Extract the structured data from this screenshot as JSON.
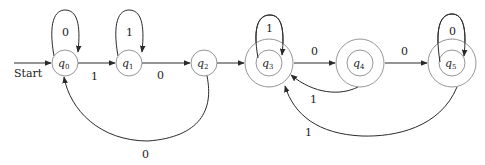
{
  "diagram": {
    "type": "dfa_state_diagram",
    "start_label": "Start",
    "start_state": "q0",
    "states": [
      {
        "id": "q0",
        "name": "q",
        "sub": "0",
        "cx": 65,
        "cy": 63,
        "accepting": false
      },
      {
        "id": "q1",
        "name": "q",
        "sub": "1",
        "cx": 129,
        "cy": 63,
        "accepting": false
      },
      {
        "id": "q2",
        "name": "q",
        "sub": "2",
        "cx": 204,
        "cy": 63,
        "accepting": false
      },
      {
        "id": "q3",
        "name": "q",
        "sub": "3",
        "cx": 269,
        "cy": 63,
        "accepting": true
      },
      {
        "id": "q4",
        "name": "q",
        "sub": "4",
        "cx": 360,
        "cy": 63,
        "accepting": true
      },
      {
        "id": "q5",
        "name": "q",
        "sub": "5",
        "cx": 452,
        "cy": 63,
        "accepting": true
      }
    ],
    "transitions": [
      {
        "from": "q0",
        "to": "q0",
        "symbol": "0"
      },
      {
        "from": "q0",
        "to": "q1",
        "symbol": "1"
      },
      {
        "from": "q1",
        "to": "q1",
        "symbol": "1"
      },
      {
        "from": "q1",
        "to": "q2",
        "symbol": "0"
      },
      {
        "from": "q2",
        "to": "q3",
        "symbol": ""
      },
      {
        "from": "q2",
        "to": "q0",
        "symbol": "0"
      },
      {
        "from": "q3",
        "to": "q3",
        "symbol": "1"
      },
      {
        "from": "q3",
        "to": "q4",
        "symbol": "0"
      },
      {
        "from": "q4",
        "to": "q5",
        "symbol": "0"
      },
      {
        "from": "q4",
        "to": "q3",
        "symbol": "1"
      },
      {
        "from": "q5",
        "to": "q5",
        "symbol": "0"
      },
      {
        "from": "q5",
        "to": "q3",
        "symbol": "1"
      }
    ],
    "labels": {
      "loop_q0": "0",
      "loop_q1": "1",
      "loop_q3": "1",
      "loop_q5": "0",
      "q0_q1": "1",
      "q1_q2": "0",
      "q3_q4": "0",
      "q4_q5": "0",
      "q4_q3": "1",
      "q5_q3": "1",
      "q2_q0": "0"
    },
    "colors": {
      "edge": "#2a2a2a",
      "state_stroke": "#8a8a8a",
      "background": "#ffffff"
    }
  }
}
